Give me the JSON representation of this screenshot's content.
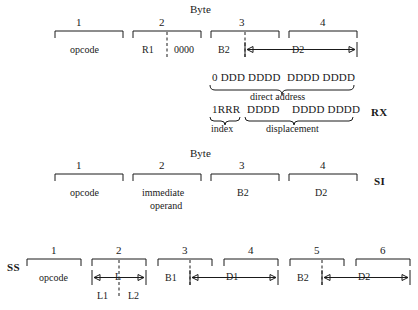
{
  "figure": {
    "byte_header": "Byte",
    "formats": [
      {
        "name": "RX",
        "label": "RX",
        "byte_numbers": [
          "1",
          "2",
          "3",
          "4"
        ],
        "fields": [
          "opcode",
          "R1",
          "0000",
          "B2",
          "D2"
        ],
        "cells": {
          "opcode": "opcode",
          "r1": "R1",
          "zeros": "0000",
          "b2": "B2",
          "d2": "D2"
        },
        "bit_rows": [
          {
            "left": "0 DDD DDDD",
            "right": "DDDD DDDD",
            "caption": "direct address"
          },
          {
            "index_bits": "1RRR",
            "mid_bits": "DDDD",
            "right_bits": "DDDD DDDD",
            "index_caption": "index",
            "displacement_caption": "displacement"
          }
        ]
      },
      {
        "name": "SI",
        "label": "SI",
        "byte_numbers": [
          "1",
          "2",
          "3",
          "4"
        ],
        "cells": {
          "opcode": "opcode",
          "immediate_line1": "immediate",
          "immediate_line2": "operand",
          "b2": "B2",
          "d2": "D2"
        }
      },
      {
        "name": "SS",
        "label": "SS",
        "byte_numbers": [
          "1",
          "2",
          "3",
          "4",
          "5",
          "6"
        ],
        "cells": {
          "opcode": "opcode",
          "l": "L",
          "l1": "L1",
          "l2": "L2",
          "b1": "B1",
          "d1": "D1",
          "b2": "B2",
          "d2": "D2"
        }
      }
    ]
  },
  "colors": {
    "ink": "#1a1a1a",
    "background": "#ffffff"
  }
}
